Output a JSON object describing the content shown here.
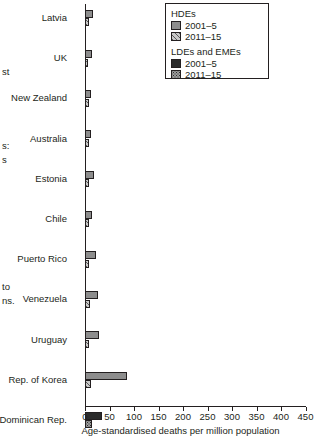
{
  "margin_fragments": [
    {
      "text": "st",
      "x": 2,
      "y": 66
    },
    {
      "text": "s:",
      "x": 2,
      "y": 140
    },
    {
      "text": "s",
      "x": 2,
      "y": 154
    },
    {
      "text": "to",
      "x": 2,
      "y": 281
    },
    {
      "text": "ns.",
      "x": 2,
      "y": 295
    }
  ],
  "legend": {
    "groups": [
      {
        "title": "HDEs",
        "entries": [
          {
            "label": "2001–5",
            "swatch": "hde-2001-5",
            "fill": "#8d8d8d"
          },
          {
            "label": "2011–15",
            "swatch": "hde-2011-15",
            "fill": "#c9c9c9"
          }
        ]
      },
      {
        "title": "LDEs and EMEs",
        "entries": [
          {
            "label": "2001–5",
            "swatch": "lde-2001-5",
            "fill": "#2b2b2b"
          },
          {
            "label": "2011–15",
            "swatch": "lde-2011-15",
            "fill": "#9c9c9c"
          }
        ]
      }
    ]
  },
  "chart_data": {
    "type": "bar",
    "orientation": "horizontal",
    "title": "",
    "xlabel": "Age-standardised deaths per million population",
    "ylabel": "",
    "xlim": [
      0,
      450
    ],
    "xticks": [
      0,
      50,
      100,
      150,
      200,
      250,
      300,
      350,
      400,
      450
    ],
    "grid": false,
    "legend_position": "top-right",
    "categories": [
      "Latvia",
      "UK",
      "New Zealand",
      "Australia",
      "Estonia",
      "Chile",
      "Puerto Rico",
      "Venezuela",
      "Uruguay",
      "Rep. of Korea",
      "Dominican Rep.",
      "Serbia",
      "Thailand",
      "Guatemala",
      "Egypt",
      "Uzbekistan",
      "Mauritius",
      "South Africa",
      "Philippines",
      "Fiji"
    ],
    "group_by_category": [
      "HDEs",
      "HDEs",
      "HDEs",
      "HDEs",
      "HDEs",
      "HDEs",
      "HDEs",
      "HDEs",
      "HDEs",
      "HDEs",
      "LDEs and EMEs",
      "LDEs and EMEs",
      "LDEs and EMEs",
      "LDEs and EMEs",
      "LDEs and EMEs",
      "LDEs and EMEs",
      "LDEs and EMEs",
      "LDEs and EMEs",
      "LDEs and EMEs",
      "LDEs and EMEs"
    ],
    "series": [
      {
        "name": "2001–5",
        "values": [
          16,
          14,
          13,
          12,
          18,
          14,
          22,
          26,
          28,
          86,
          34,
          25,
          22,
          30,
          22,
          58,
          190,
          212,
          200,
          415
        ]
      },
      {
        "name": "2011–15",
        "values": [
          8,
          7,
          8,
          8,
          8,
          8,
          9,
          10,
          9,
          12,
          14,
          13,
          14,
          14,
          14,
          32,
          88,
          112,
          152,
          232
        ]
      }
    ]
  }
}
